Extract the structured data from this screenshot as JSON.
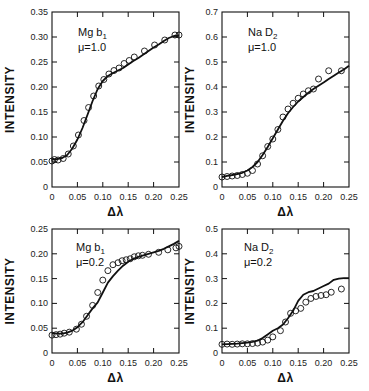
{
  "chart_data": [
    {
      "id": "tl",
      "type": "line",
      "title": "",
      "annotation": [
        "Mg b1",
        "μ=1.0"
      ],
      "xlabel": "Δλ",
      "ylabel": "INTENSITY",
      "xlim": [
        0,
        0.25
      ],
      "ylim": [
        0,
        0.35
      ],
      "xticks": [
        "0",
        "0.05",
        "0.10",
        "0.15",
        "0.20",
        "0.25"
      ],
      "yticks": [
        "0",
        "0.05",
        "0.10",
        "0.15",
        "0.20",
        "0.25",
        "0.30",
        "0.35"
      ],
      "grid": false,
      "series": [
        {
          "name": "computed",
          "style": "line",
          "x": [
            0,
            0.01,
            0.02,
            0.03,
            0.04,
            0.05,
            0.06,
            0.07,
            0.08,
            0.09,
            0.1,
            0.11,
            0.12,
            0.13,
            0.14,
            0.15,
            0.16,
            0.17,
            0.18,
            0.19,
            0.2,
            0.21,
            0.22,
            0.23,
            0.24,
            0.25
          ],
          "y": [
            0.055,
            0.056,
            0.058,
            0.064,
            0.077,
            0.095,
            0.118,
            0.145,
            0.172,
            0.196,
            0.212,
            0.222,
            0.228,
            0.233,
            0.238,
            0.245,
            0.252,
            0.258,
            0.265,
            0.272,
            0.279,
            0.285,
            0.292,
            0.298,
            0.302,
            0.303
          ]
        },
        {
          "name": "observed",
          "style": "circles",
          "x": [
            0.0,
            0.005,
            0.012,
            0.022,
            0.032,
            0.042,
            0.052,
            0.063,
            0.072,
            0.082,
            0.092,
            0.102,
            0.112,
            0.122,
            0.132,
            0.142,
            0.152,
            0.162,
            0.182,
            0.202,
            0.222,
            0.242,
            0.25
          ],
          "y": [
            0.052,
            0.055,
            0.054,
            0.057,
            0.066,
            0.082,
            0.104,
            0.133,
            0.159,
            0.182,
            0.202,
            0.215,
            0.226,
            0.233,
            0.238,
            0.247,
            0.253,
            0.26,
            0.272,
            0.284,
            0.294,
            0.304,
            0.304
          ]
        }
      ]
    },
    {
      "id": "tr",
      "type": "line",
      "title": "",
      "annotation": [
        "Na D2",
        "μ=1.0"
      ],
      "xlabel": "Δλ",
      "ylabel": "INTENSITY",
      "xlim": [
        0,
        0.25
      ],
      "ylim": [
        0,
        0.7
      ],
      "xticks": [
        "0",
        "0.05",
        "0.10",
        "0.15",
        "0.20",
        "0.25"
      ],
      "yticks": [
        "0",
        "0.1",
        "0.2",
        "0.3",
        "0.4",
        "0.5",
        "0.6",
        "0.7"
      ],
      "grid": false,
      "series": [
        {
          "name": "computed",
          "style": "line",
          "x": [
            0,
            0.01,
            0.02,
            0.03,
            0.04,
            0.05,
            0.06,
            0.07,
            0.08,
            0.09,
            0.1,
            0.11,
            0.12,
            0.13,
            0.14,
            0.15,
            0.16,
            0.17,
            0.18,
            0.19,
            0.2,
            0.21,
            0.22,
            0.23,
            0.24,
            0.25
          ],
          "y": [
            0.04,
            0.045,
            0.048,
            0.052,
            0.057,
            0.066,
            0.08,
            0.1,
            0.128,
            0.16,
            0.195,
            0.23,
            0.265,
            0.295,
            0.32,
            0.342,
            0.36,
            0.377,
            0.392,
            0.405,
            0.418,
            0.432,
            0.445,
            0.458,
            0.47,
            0.485
          ]
        },
        {
          "name": "observed",
          "style": "circles",
          "x": [
            0.0,
            0.01,
            0.02,
            0.03,
            0.04,
            0.05,
            0.06,
            0.07,
            0.08,
            0.09,
            0.1,
            0.11,
            0.12,
            0.13,
            0.14,
            0.15,
            0.16,
            0.17,
            0.18,
            0.19,
            0.21,
            0.235
          ],
          "y": [
            0.04,
            0.042,
            0.044,
            0.046,
            0.05,
            0.055,
            0.066,
            0.092,
            0.125,
            0.162,
            0.192,
            0.23,
            0.28,
            0.312,
            0.335,
            0.355,
            0.372,
            0.385,
            0.392,
            0.432,
            0.465,
            0.465
          ]
        }
      ]
    },
    {
      "id": "bl",
      "type": "line",
      "title": "",
      "annotation": [
        "Mg b1",
        "μ=0.2"
      ],
      "xlabel": "Δλ",
      "ylabel": "INTENSITY",
      "xlim": [
        0,
        0.25
      ],
      "ylim": [
        0,
        0.25
      ],
      "xticks": [
        "0",
        "0.05",
        "0.10",
        "0.15",
        "0.20",
        "0.25"
      ],
      "yticks": [
        "0",
        "0.05",
        "0.10",
        "0.15",
        "0.20",
        "0.25"
      ],
      "grid": false,
      "series": [
        {
          "name": "computed",
          "style": "line",
          "x": [
            0,
            0.01,
            0.02,
            0.03,
            0.04,
            0.05,
            0.06,
            0.07,
            0.08,
            0.09,
            0.1,
            0.11,
            0.12,
            0.13,
            0.14,
            0.15,
            0.16,
            0.17,
            0.18,
            0.19,
            0.2,
            0.21,
            0.22,
            0.23,
            0.24,
            0.25
          ],
          "y": [
            0.04,
            0.039,
            0.039,
            0.041,
            0.045,
            0.052,
            0.062,
            0.076,
            0.09,
            0.102,
            0.122,
            0.142,
            0.155,
            0.166,
            0.176,
            0.184,
            0.19,
            0.194,
            0.197,
            0.2,
            0.203,
            0.206,
            0.21,
            0.215,
            0.22,
            0.226
          ]
        },
        {
          "name": "observed",
          "style": "circles",
          "x": [
            0.0,
            0.008,
            0.016,
            0.024,
            0.034,
            0.048,
            0.058,
            0.068,
            0.08,
            0.09,
            0.1,
            0.11,
            0.12,
            0.13,
            0.138,
            0.146,
            0.154,
            0.162,
            0.17,
            0.178,
            0.19,
            0.21,
            0.228,
            0.244,
            0.25
          ],
          "y": [
            0.036,
            0.037,
            0.038,
            0.04,
            0.042,
            0.048,
            0.058,
            0.074,
            0.096,
            0.122,
            0.147,
            0.166,
            0.178,
            0.182,
            0.186,
            0.188,
            0.19,
            0.194,
            0.196,
            0.197,
            0.199,
            0.203,
            0.208,
            0.212,
            0.215
          ]
        }
      ]
    },
    {
      "id": "br",
      "type": "line",
      "title": "",
      "annotation": [
        "Na D2",
        "μ=0.2"
      ],
      "xlabel": "Δλ",
      "ylabel": "INTENSITY",
      "xlim": [
        0,
        0.25
      ],
      "ylim": [
        0,
        0.5
      ],
      "xticks": [
        "0",
        "0.05",
        "0.10",
        "0.15",
        "0.20",
        "0.25"
      ],
      "yticks": [
        "0",
        "0.1",
        "0.2",
        "0.3",
        "0.4",
        "0.5"
      ],
      "grid": false,
      "series": [
        {
          "name": "computed",
          "style": "line",
          "x": [
            0,
            0.01,
            0.02,
            0.03,
            0.04,
            0.05,
            0.06,
            0.07,
            0.08,
            0.09,
            0.1,
            0.11,
            0.12,
            0.13,
            0.14,
            0.15,
            0.16,
            0.17,
            0.18,
            0.19,
            0.2,
            0.21,
            0.22,
            0.23,
            0.24,
            0.25
          ],
          "y": [
            0.035,
            0.036,
            0.037,
            0.038,
            0.04,
            0.042,
            0.045,
            0.05,
            0.06,
            0.075,
            0.09,
            0.1,
            0.115,
            0.14,
            0.17,
            0.21,
            0.235,
            0.245,
            0.25,
            0.26,
            0.27,
            0.28,
            0.295,
            0.3,
            0.302,
            0.302
          ]
        },
        {
          "name": "observed",
          "style": "circles",
          "x": [
            0.0,
            0.01,
            0.02,
            0.03,
            0.04,
            0.05,
            0.06,
            0.07,
            0.08,
            0.09,
            0.1,
            0.115,
            0.125,
            0.135,
            0.145,
            0.155,
            0.165,
            0.175,
            0.185,
            0.195,
            0.205,
            0.215,
            0.235
          ],
          "y": [
            0.035,
            0.036,
            0.035,
            0.036,
            0.037,
            0.037,
            0.038,
            0.04,
            0.044,
            0.052,
            0.065,
            0.09,
            0.125,
            0.16,
            0.17,
            0.18,
            0.205,
            0.22,
            0.228,
            0.232,
            0.235,
            0.245,
            0.258
          ]
        }
      ]
    }
  ]
}
